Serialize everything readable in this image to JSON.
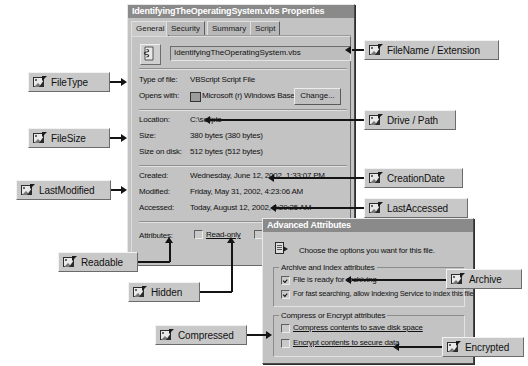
{
  "properties_dialog": {
    "title": "IdentifyingTheOperatingSystem.vbs Properties",
    "tabs": [
      {
        "label": "General",
        "active": true
      },
      {
        "label": "Security",
        "active": false
      },
      {
        "label": "Summary",
        "active": false
      },
      {
        "label": "Script",
        "active": false
      }
    ],
    "filename_field": {
      "value": "IdentifyingTheOperatingSystem.vbs",
      "icon": "script-file-icon"
    },
    "fields": [
      {
        "label": "Type of file:",
        "value": "VBScript Script File"
      },
      {
        "label": "Opens with:",
        "value": "Microsoft (r) Windows Based S"
      },
      {
        "label": "Location:",
        "value": "C:\\scripts"
      },
      {
        "label": "Size:",
        "value": "380 bytes (380 bytes)"
      },
      {
        "label": "Size on disk:",
        "value": "512 bytes (512 bytes)"
      },
      {
        "label": "Created:",
        "value": "Wednesday, June 12, 2002, 1:33:07 PM"
      },
      {
        "label": "Modified:",
        "value": "Friday, May 31, 2002, 4:23:06 AM"
      },
      {
        "label": "Accessed:",
        "value": "Today, August 12, 2002, 8:29:25 AM"
      }
    ],
    "change_button": "Change...",
    "attributes_label": "Attributes:",
    "attribute_checkboxes": [
      {
        "label": "Read-only",
        "checked": false
      },
      {
        "label": "Hidden",
        "checked": false
      }
    ]
  },
  "advanced_dialog": {
    "title": "Advanced Attributes",
    "instruction": "Choose the options you want for this file.",
    "groups": [
      {
        "title": "Archive and Index attributes",
        "options": [
          {
            "label": "File is ready for archiving",
            "checked": true
          },
          {
            "label": "For fast searching, allow Indexing Service to index this file",
            "checked": true
          }
        ]
      },
      {
        "title": "Compress or Encrypt attributes",
        "options": [
          {
            "label": "Compress contents to save disk space",
            "checked": false
          },
          {
            "label": "Encrypt contents to secure data",
            "checked": false
          }
        ]
      }
    ]
  },
  "callouts": [
    {
      "id": "filetype",
      "label": "FileType"
    },
    {
      "id": "filesize",
      "label": "FileSize"
    },
    {
      "id": "lastmodified",
      "label": "LastModified"
    },
    {
      "id": "readable",
      "label": "Readable"
    },
    {
      "id": "hidden",
      "label": "Hidden"
    },
    {
      "id": "compressed",
      "label": "Compressed"
    },
    {
      "id": "filename_extension",
      "label": "FileName / Extension"
    },
    {
      "id": "drive_path",
      "label": "Drive / Path"
    },
    {
      "id": "creationdate",
      "label": "CreationDate"
    },
    {
      "id": "lastaccessed",
      "label": "LastAccessed"
    },
    {
      "id": "archive",
      "label": "Archive"
    },
    {
      "id": "encrypted",
      "label": "Encrypted"
    }
  ],
  "colors": {
    "dialog_face": "#c3c3c3",
    "titlebar": "#8a8a8a",
    "callout_face": "#c8c8c8",
    "line": "#141414"
  }
}
